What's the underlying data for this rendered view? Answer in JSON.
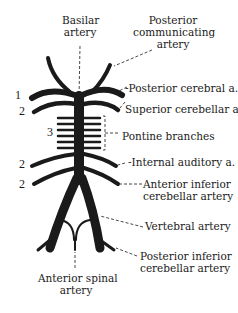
{
  "diagram": {
    "labels": {
      "basilar_line1": "Basilar",
      "basilar_line2": "artery",
      "pcom_line1": "Posterior",
      "pcom_line2": "communicating",
      "pcom_line3": "artery",
      "posterior_cerebral": "-Posterior cerebral a.",
      "superior_cerebellar": "Superior cerebellar a.",
      "pontine": "Pontine branches",
      "internal_auditory": "-Internal auditory a.",
      "aica_line1": "Anterior inferior",
      "aica_line2": "cerebellar artery",
      "vertebral": "Vertebral artery",
      "pica_line1": "Posterior inferior",
      "pica_line2": "cerebellar artery",
      "asa_line1": "Anterior spinal",
      "asa_line2": "artery"
    },
    "numbers": {
      "n1": "1",
      "n2a": "2",
      "n3": "3",
      "n2b": "2",
      "n2c": "2"
    },
    "colors": {
      "vessel": "#1a1a1a",
      "text": "#1a1a1a",
      "background": "#ffffff"
    }
  }
}
